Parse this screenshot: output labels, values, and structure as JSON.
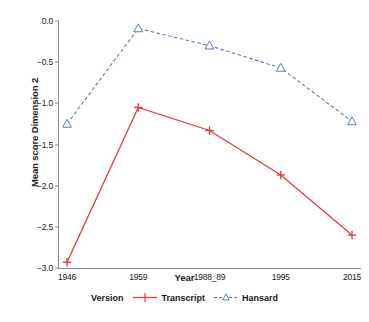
{
  "chart_data": {
    "type": "line",
    "title": "",
    "xlabel": "Year",
    "ylabel": "Mean score Dimension 2",
    "categories": [
      "1946",
      "1959",
      "1988_89",
      "1995",
      "2015"
    ],
    "ylim": [
      -3.0,
      0.0
    ],
    "yticks": [
      "0.0",
      "-0.5",
      "-1.0",
      "-1.5",
      "-2.0",
      "-2.5",
      "-3.0"
    ],
    "ytick_values": [
      0.0,
      -0.5,
      -1.0,
      -1.5,
      -2.0,
      -2.5,
      -3.0
    ],
    "grid": false,
    "legend_position": "bottom",
    "legend_title": "Version",
    "series": [
      {
        "name": "Transcript",
        "values": [
          -2.93,
          -1.05,
          -1.33,
          -1.87,
          -2.6
        ],
        "color": "#e8393c",
        "marker": "plus",
        "linestyle": "solid"
      },
      {
        "name": "Hansard",
        "values": [
          -1.25,
          -0.09,
          -0.3,
          -0.57,
          -1.22
        ],
        "color": "#5b7fb5",
        "marker": "triangle",
        "linestyle": "dashed"
      }
    ]
  },
  "axes": {
    "y_title": "Mean score Dimension 2",
    "x_title": "Year"
  },
  "legend": {
    "title": "Version",
    "entries": [
      {
        "label": "Transcript",
        "color": "#e8393c"
      },
      {
        "label": "Hansard",
        "color": "#5b7fb5"
      }
    ]
  },
  "colors": {
    "transcript": "#e8393c",
    "hansard": "#5b7fb5",
    "axis": "#8a8a8a",
    "text": "#1a1a1a",
    "background": "#ffffff"
  }
}
